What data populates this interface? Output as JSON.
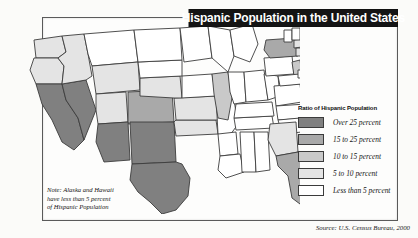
{
  "title": "Hispanic Population in the United States",
  "legend": {
    "title": "Ratio of Hispanic Population",
    "entries": [
      {
        "label": "Over 25 percent",
        "color": "#808080"
      },
      {
        "label": "15 to 25 percent",
        "color": "#a9a9a9"
      },
      {
        "label": "10 to 15 percent",
        "color": "#c9c9c9"
      },
      {
        "label": "5 to 10 percent",
        "color": "#e4e4e4"
      },
      {
        "label": "Less than 5 percent",
        "color": "#ffffff"
      }
    ]
  },
  "note": {
    "line1": "Note: Alaska and Hawaii",
    "line2": "have less than 5 percent",
    "line3": "of Hispanic Population"
  },
  "source": "Source: U.S. Census Bureau, 2000",
  "chart_data": {
    "type": "map",
    "title": "Hispanic Population in the United States",
    "unit": "percent of state population that is Hispanic",
    "bins": [
      "Less than 5 percent",
      "5 to 10 percent",
      "10 to 15 percent",
      "15 to 25 percent",
      "Over 25 percent"
    ],
    "bin_colors": [
      "#ffffff",
      "#e4e4e4",
      "#c9c9c9",
      "#a9a9a9",
      "#808080"
    ],
    "source": "U.S. Census Bureau, 2000",
    "note": "Alaska and Hawaii have less than 5 percent of Hispanic Population",
    "states": [
      {
        "code": "WA",
        "name": "Washington",
        "bin": "5 to 10 percent"
      },
      {
        "code": "OR",
        "name": "Oregon",
        "bin": "5 to 10 percent"
      },
      {
        "code": "CA",
        "name": "California",
        "bin": "Over 25 percent"
      },
      {
        "code": "NV",
        "name": "Nevada",
        "bin": "Over 25 percent"
      },
      {
        "code": "ID",
        "name": "Idaho",
        "bin": "5 to 10 percent"
      },
      {
        "code": "MT",
        "name": "Montana",
        "bin": "Less than 5 percent"
      },
      {
        "code": "WY",
        "name": "Wyoming",
        "bin": "5 to 10 percent"
      },
      {
        "code": "UT",
        "name": "Utah",
        "bin": "5 to 10 percent"
      },
      {
        "code": "AZ",
        "name": "Arizona",
        "bin": "Over 25 percent"
      },
      {
        "code": "CO",
        "name": "Colorado",
        "bin": "15 to 25 percent"
      },
      {
        "code": "NM",
        "name": "New Mexico",
        "bin": "Over 25 percent"
      },
      {
        "code": "TX",
        "name": "Texas",
        "bin": "Over 25 percent"
      },
      {
        "code": "OK",
        "name": "Oklahoma",
        "bin": "5 to 10 percent"
      },
      {
        "code": "KS",
        "name": "Kansas",
        "bin": "5 to 10 percent"
      },
      {
        "code": "NE",
        "name": "Nebraska",
        "bin": "5 to 10 percent"
      },
      {
        "code": "SD",
        "name": "South Dakota",
        "bin": "Less than 5 percent"
      },
      {
        "code": "ND",
        "name": "North Dakota",
        "bin": "Less than 5 percent"
      },
      {
        "code": "MN",
        "name": "Minnesota",
        "bin": "Less than 5 percent"
      },
      {
        "code": "IA",
        "name": "Iowa",
        "bin": "Less than 5 percent"
      },
      {
        "code": "MO",
        "name": "Missouri",
        "bin": "Less than 5 percent"
      },
      {
        "code": "AR",
        "name": "Arkansas",
        "bin": "Less than 5 percent"
      },
      {
        "code": "LA",
        "name": "Louisiana",
        "bin": "Less than 5 percent"
      },
      {
        "code": "MS",
        "name": "Mississippi",
        "bin": "Less than 5 percent"
      },
      {
        "code": "AL",
        "name": "Alabama",
        "bin": "Less than 5 percent"
      },
      {
        "code": "TN",
        "name": "Tennessee",
        "bin": "Less than 5 percent"
      },
      {
        "code": "KY",
        "name": "Kentucky",
        "bin": "Less than 5 percent"
      },
      {
        "code": "IL",
        "name": "Illinois",
        "bin": "10 to 15 percent"
      },
      {
        "code": "WI",
        "name": "Wisconsin",
        "bin": "Less than 5 percent"
      },
      {
        "code": "MI",
        "name": "Michigan",
        "bin": "Less than 5 percent"
      },
      {
        "code": "IN",
        "name": "Indiana",
        "bin": "Less than 5 percent"
      },
      {
        "code": "OH",
        "name": "Ohio",
        "bin": "Less than 5 percent"
      },
      {
        "code": "WV",
        "name": "West Virginia",
        "bin": "Less than 5 percent"
      },
      {
        "code": "VA",
        "name": "Virginia",
        "bin": "Less than 5 percent"
      },
      {
        "code": "NC",
        "name": "North Carolina",
        "bin": "Less than 5 percent"
      },
      {
        "code": "SC",
        "name": "South Carolina",
        "bin": "Less than 5 percent"
      },
      {
        "code": "GA",
        "name": "Georgia",
        "bin": "5 to 10 percent"
      },
      {
        "code": "FL",
        "name": "Florida",
        "bin": "15 to 25 percent"
      },
      {
        "code": "PA",
        "name": "Pennsylvania",
        "bin": "Less than 5 percent"
      },
      {
        "code": "NY",
        "name": "New York",
        "bin": "15 to 25 percent"
      },
      {
        "code": "NJ",
        "name": "New Jersey",
        "bin": "10 to 15 percent"
      },
      {
        "code": "MD",
        "name": "Maryland",
        "bin": "Less than 5 percent"
      },
      {
        "code": "DE",
        "name": "Delaware",
        "bin": "Less than 5 percent"
      },
      {
        "code": "CT",
        "name": "Connecticut",
        "bin": "5 to 10 percent"
      },
      {
        "code": "RI",
        "name": "Rhode Island",
        "bin": "5 to 10 percent"
      },
      {
        "code": "MA",
        "name": "Massachusetts",
        "bin": "5 to 10 percent"
      },
      {
        "code": "VT",
        "name": "Vermont",
        "bin": "Less than 5 percent"
      },
      {
        "code": "NH",
        "name": "New Hampshire",
        "bin": "Less than 5 percent"
      },
      {
        "code": "ME",
        "name": "Maine",
        "bin": "Less than 5 percent"
      }
    ]
  }
}
